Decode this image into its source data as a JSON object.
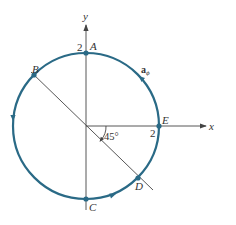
{
  "diagram": {
    "type": "circular path in xy-plane with azimuthal unit vector",
    "colors": {
      "circle": "#2a6a86",
      "axes": "#444444",
      "text": "#333333",
      "background": "#ffffff"
    },
    "axes": {
      "x_label": "x",
      "y_label": "y"
    },
    "radius_label_top": "2",
    "radius_label_right": "2",
    "points": [
      {
        "name": "A",
        "angle_deg": 90
      },
      {
        "name": "B",
        "angle_deg": 135
      },
      {
        "name": "C",
        "angle_deg": 270
      },
      {
        "name": "D",
        "angle_deg": 315
      },
      {
        "name": "E",
        "angle_deg": 0
      }
    ],
    "vector_label": "a",
    "vector_subscript": "ϕ",
    "angle_label": "45°",
    "direction_arrows": "counterclockwise"
  }
}
